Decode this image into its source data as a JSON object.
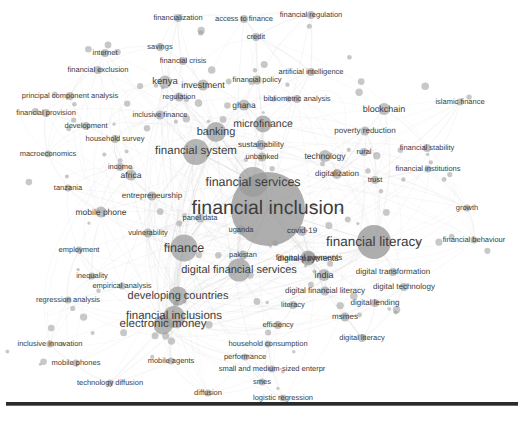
{
  "view": {
    "background_color": "#ffffff",
    "label_color": "#3d3d3d",
    "node_color": "#9a9a9a",
    "link_color": "#cfcfcf",
    "rule_color": "#2a2a2a",
    "width": 524,
    "height": 421
  },
  "chart_data": {
    "type": "scatter",
    "title": "",
    "subtitle": "",
    "xlabel": "",
    "ylabel": "",
    "grid": false,
    "legend": "none",
    "xlim": [
      0,
      524
    ],
    "ylim": [
      0,
      421
    ],
    "nodes": [
      {
        "label": "financial inclusion",
        "x": 268,
        "y": 209,
        "size": 74,
        "font": 19.5
      },
      {
        "label": "financial services",
        "x": 253,
        "y": 182,
        "size": 30,
        "font": 12.5
      },
      {
        "label": "financial literacy",
        "x": 374,
        "y": 242,
        "size": 34,
        "font": 13.5
      },
      {
        "label": "financial system",
        "x": 196,
        "y": 152,
        "size": 26,
        "font": 11.5
      },
      {
        "label": "finance",
        "x": 184,
        "y": 248,
        "size": 27,
        "font": 12.5
      },
      {
        "label": "financial inclusions",
        "x": 174,
        "y": 317,
        "size": 22,
        "font": 11.5
      },
      {
        "label": "digital financial services",
        "x": 239,
        "y": 270,
        "size": 23,
        "font": 11
      },
      {
        "label": "developing countries",
        "x": 178,
        "y": 296,
        "size": 19,
        "font": 11
      },
      {
        "label": "electronic money",
        "x": 163,
        "y": 325,
        "size": 19,
        "font": 11.5
      },
      {
        "label": "banking",
        "x": 216,
        "y": 132,
        "size": 20,
        "font": 11
      },
      {
        "label": "microfinance",
        "x": 263,
        "y": 124,
        "size": 17,
        "font": 10.5
      },
      {
        "label": "financial payments",
        "x": 309,
        "y": 258,
        "size": 13,
        "font": 8
      },
      {
        "label": "digital payments",
        "x": 308,
        "y": 258,
        "size": 15,
        "font": 8.5
      },
      {
        "label": "blockchain",
        "x": 384,
        "y": 109,
        "size": 12,
        "font": 9
      },
      {
        "label": "technology",
        "x": 325,
        "y": 156,
        "size": 12,
        "font": 8.5
      },
      {
        "label": "sustainability",
        "x": 261,
        "y": 145,
        "size": 10,
        "font": 8
      },
      {
        "label": "unbanked",
        "x": 262,
        "y": 157,
        "size": 9,
        "font": 7.5
      },
      {
        "label": "digitalization",
        "x": 337,
        "y": 174,
        "size": 10,
        "font": 8
      },
      {
        "label": "poverty reduction",
        "x": 365,
        "y": 131,
        "size": 9,
        "font": 8
      },
      {
        "label": "africa",
        "x": 131,
        "y": 175,
        "size": 11,
        "font": 8.5
      },
      {
        "label": "entrepreneurship",
        "x": 152,
        "y": 196,
        "size": 9,
        "font": 8
      },
      {
        "label": "panel data",
        "x": 200,
        "y": 218,
        "size": 9,
        "font": 7.5
      },
      {
        "label": "vulnerability",
        "x": 148,
        "y": 233,
        "size": 9,
        "font": 7.5
      },
      {
        "label": "mobile phone",
        "x": 101,
        "y": 212,
        "size": 11,
        "font": 8.5
      },
      {
        "label": "income",
        "x": 120,
        "y": 167,
        "size": 8,
        "font": 7.5
      },
      {
        "label": "tanzania",
        "x": 68,
        "y": 188,
        "size": 7,
        "font": 7.5
      },
      {
        "label": "macroeconomics",
        "x": 48,
        "y": 154,
        "size": 7,
        "font": 7.5
      },
      {
        "label": "employment",
        "x": 79,
        "y": 250,
        "size": 7,
        "font": 7.5
      },
      {
        "label": "inequality",
        "x": 92,
        "y": 276,
        "size": 7,
        "font": 7.5
      },
      {
        "label": "empirical analysis",
        "x": 122,
        "y": 286,
        "size": 7,
        "font": 7.5
      },
      {
        "label": "regression analysis",
        "x": 68,
        "y": 300,
        "size": 7,
        "font": 7.5
      },
      {
        "label": "inclusive innovation",
        "x": 50,
        "y": 344,
        "size": 7,
        "font": 7.5
      },
      {
        "label": "mobile phones",
        "x": 76,
        "y": 363,
        "size": 7,
        "font": 7.5
      },
      {
        "label": "technology diffusion",
        "x": 110,
        "y": 383,
        "size": 7,
        "font": 7.5
      },
      {
        "label": "mobile agents",
        "x": 171,
        "y": 361,
        "size": 7,
        "font": 7.5
      },
      {
        "label": "diffusion",
        "x": 208,
        "y": 393,
        "size": 7,
        "font": 7.5
      },
      {
        "label": "logistic regression",
        "x": 283,
        "y": 398,
        "size": 7,
        "font": 7.5
      },
      {
        "label": "smes",
        "x": 262,
        "y": 382,
        "size": 7,
        "font": 7.5
      },
      {
        "label": "small and medium-sized enterpr",
        "x": 272,
        "y": 369,
        "size": 7,
        "font": 7.5
      },
      {
        "label": "performance",
        "x": 245,
        "y": 357,
        "size": 7,
        "font": 7.5
      },
      {
        "label": "household consumption",
        "x": 268,
        "y": 344,
        "size": 7,
        "font": 7.5
      },
      {
        "label": "efficiency",
        "x": 278,
        "y": 325,
        "size": 8,
        "font": 7.5
      },
      {
        "label": "digital literacy",
        "x": 362,
        "y": 338,
        "size": 8,
        "font": 7.5
      },
      {
        "label": "msmes",
        "x": 345,
        "y": 317,
        "size": 9,
        "font": 8
      },
      {
        "label": "digital lending",
        "x": 375,
        "y": 303,
        "size": 8,
        "font": 8
      },
      {
        "label": "digital financial literacy",
        "x": 325,
        "y": 291,
        "size": 9,
        "font": 8
      },
      {
        "label": "digital technology",
        "x": 404,
        "y": 287,
        "size": 8,
        "font": 8
      },
      {
        "label": "digital transformation",
        "x": 393,
        "y": 272,
        "size": 8,
        "font": 8
      },
      {
        "label": "literacy",
        "x": 293,
        "y": 305,
        "size": 8,
        "font": 7.5
      },
      {
        "label": "india",
        "x": 324,
        "y": 275,
        "size": 12,
        "font": 9
      },
      {
        "label": "pakistan",
        "x": 243,
        "y": 255,
        "size": 9,
        "font": 7.5
      },
      {
        "label": "uganda",
        "x": 241,
        "y": 230,
        "size": 9,
        "font": 7.5
      },
      {
        "label": "covid-19",
        "x": 302,
        "y": 231,
        "size": 10,
        "font": 8
      },
      {
        "label": "financial behaviour",
        "x": 474,
        "y": 240,
        "size": 7,
        "font": 7.5
      },
      {
        "label": "growth",
        "x": 467,
        "y": 208,
        "size": 7,
        "font": 7.5
      },
      {
        "label": "financial institutions",
        "x": 428,
        "y": 169,
        "size": 7,
        "font": 7.5
      },
      {
        "label": "financial stability",
        "x": 427,
        "y": 148,
        "size": 8,
        "font": 7.5
      },
      {
        "label": "trust",
        "x": 375,
        "y": 180,
        "size": 8,
        "font": 7.5
      },
      {
        "label": "rural",
        "x": 364,
        "y": 152,
        "size": 8,
        "font": 7.5
      },
      {
        "label": "islamic finance",
        "x": 460,
        "y": 102,
        "size": 7,
        "font": 7.5
      },
      {
        "label": "bibliometric analysis",
        "x": 297,
        "y": 99,
        "size": 8,
        "font": 7.5
      },
      {
        "label": "artificial intelligence",
        "x": 311,
        "y": 72,
        "size": 8,
        "font": 7.5
      },
      {
        "label": "financial regulation",
        "x": 311,
        "y": 15,
        "size": 8,
        "font": 7.5
      },
      {
        "label": "access to finance",
        "x": 244,
        "y": 19,
        "size": 8,
        "font": 7.5
      },
      {
        "label": "financialization",
        "x": 178,
        "y": 18,
        "size": 8,
        "font": 7.5
      },
      {
        "label": "credit",
        "x": 256,
        "y": 37,
        "size": 8,
        "font": 7.5
      },
      {
        "label": "savings",
        "x": 160,
        "y": 47,
        "size": 8,
        "font": 7.5
      },
      {
        "label": "financial crisis",
        "x": 183,
        "y": 61,
        "size": 8,
        "font": 7.5
      },
      {
        "label": "internet",
        "x": 105,
        "y": 53,
        "size": 8,
        "font": 7.5
      },
      {
        "label": "financial exclusion",
        "x": 98,
        "y": 70,
        "size": 8,
        "font": 7.5
      },
      {
        "label": "kenya",
        "x": 165,
        "y": 82,
        "size": 13,
        "font": 9.5
      },
      {
        "label": "investment",
        "x": 203,
        "y": 85,
        "size": 11,
        "font": 9
      },
      {
        "label": "financial policy",
        "x": 257,
        "y": 80,
        "size": 9,
        "font": 7.5
      },
      {
        "label": "ghana",
        "x": 244,
        "y": 105,
        "size": 11,
        "font": 8.5
      },
      {
        "label": "regulation",
        "x": 179,
        "y": 97,
        "size": 9,
        "font": 7.5
      },
      {
        "label": "principal component analysis",
        "x": 70,
        "y": 96,
        "size": 8,
        "font": 7.5
      },
      {
        "label": "financial provision",
        "x": 46,
        "y": 113,
        "size": 8,
        "font": 7.5
      },
      {
        "label": "inclusive finance",
        "x": 160,
        "y": 115,
        "size": 9,
        "font": 7.5
      },
      {
        "label": "development",
        "x": 86,
        "y": 126,
        "size": 8,
        "font": 7.5
      },
      {
        "label": "household survey",
        "x": 115,
        "y": 139,
        "size": 8,
        "font": 7.5
      }
    ]
  }
}
